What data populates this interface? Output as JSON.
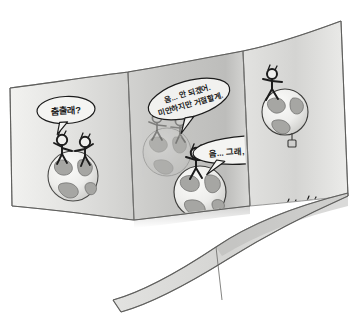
{
  "artwork": {
    "title": "Dance invitation comic strip",
    "medium": "grayscale pencil cartoon on curved ribbon",
    "panel_count": 3
  },
  "palette": {
    "background": "#ffffff",
    "ribbon_light": "#e9e9e7",
    "ribbon_mid": "#d6d6d4",
    "ribbon_dark": "#b4b4b2",
    "ribbon_shadow": "#9a9a98",
    "ink": "#1c1c1c",
    "outline": "#4a4a48",
    "globe_ocean": "#efefed",
    "globe_land": "#a9a9a6",
    "globe_land_dark": "#8d8d8a",
    "bubble_fill": "#f4f4f2",
    "ghost": "#c2c2c0"
  },
  "panels": [
    {
      "id": "panel-1",
      "name": "invitation",
      "globe_count": 1,
      "figure_count": 2,
      "description": "Two stick figures standing together on a globe"
    },
    {
      "id": "panel-2",
      "name": "refusal",
      "globe_count": 2,
      "figure_count": 3,
      "description": "A ghosted globe with a departing figure and a solid globe below with figures"
    },
    {
      "id": "panel-3",
      "name": "acceptance",
      "globe_count": 2,
      "figure_count": 5,
      "description": "A lone figure on an upper globe and a crowd of dancing figures on a lower globe"
    }
  ],
  "bubbles": [
    {
      "id": "bubble-invite",
      "panel": "panel-1",
      "speaker": "left figure",
      "lines": [
        "춤출래?"
      ],
      "rotation_deg": -3
    },
    {
      "id": "bubble-refuse",
      "panel": "panel-2",
      "speaker": "upper figure",
      "lines": [
        "음... 안 되겠어.",
        "미안하지만 거절할게."
      ],
      "rotation_deg": -16
    },
    {
      "id": "bubble-accept",
      "panel": "panel-2",
      "speaker": "lower figure",
      "lines": [
        "음... 그래, 얼마든지!"
      ],
      "rotation_deg": -4
    }
  ]
}
